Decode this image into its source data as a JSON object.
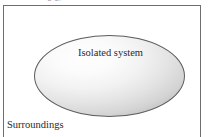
{
  "figure": {
    "name": "isolated-system-diagram",
    "clipped_caption_fragment": "g                                       g)",
    "system_label": "Isolated system",
    "surroundings_label": "Surroundings",
    "colors": {
      "page_background": "#ffffff",
      "frame_rule": "#6e6e6e",
      "ellipse_outline": "#5d5d5d",
      "ellipse_fill_light": "#fefefe",
      "ellipse_fill_dark": "#c9c9c9",
      "text": "#2b2b2b",
      "clipped_caption_text": "#8d8d8d"
    }
  }
}
